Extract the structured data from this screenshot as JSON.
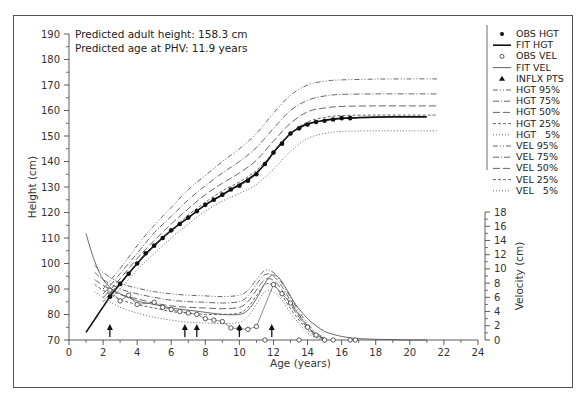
{
  "chart_data": {
    "type": "line",
    "title": "",
    "annotations": [
      "Predicted adult height: 158.3 cm",
      "Predicted age at PHV: 11.9 years"
    ],
    "xlabel": "Age (years)",
    "ylabel": "Height (cm)",
    "y2label": "Velocity (cm)",
    "xlim": [
      0,
      24
    ],
    "ylim": [
      70,
      190
    ],
    "y2lim": [
      0,
      18
    ],
    "x_ticks": [
      "0",
      "2",
      "4",
      "6",
      "8",
      "10",
      "12",
      "14",
      "16",
      "18",
      "20",
      "22",
      "24"
    ],
    "y_ticks": [
      "70",
      "80",
      "90",
      "100",
      "110",
      "120",
      "130",
      "140",
      "150",
      "160",
      "170",
      "180",
      "190"
    ],
    "y2_ticks": [
      "0",
      "2",
      "4",
      "6",
      "8",
      "10",
      "12",
      "14",
      "16",
      "18"
    ],
    "grid": false,
    "legend_position": "right",
    "legend": [
      {
        "label": "OBS HGT",
        "style": "filled-dot"
      },
      {
        "label": "FIT HGT",
        "style": "solid-thick"
      },
      {
        "label": "OBS VEL",
        "style": "open-circle"
      },
      {
        "label": "FIT VEL",
        "style": "solid-thin"
      },
      {
        "label": "INFLX PTS",
        "style": "triangle"
      },
      {
        "label": "HGT 95%",
        "style": "dash-dot-dot"
      },
      {
        "label": "HGT 75%",
        "style": "dash-dot"
      },
      {
        "label": "HGT 50%",
        "style": "long-dash"
      },
      {
        "label": "HGT 25%",
        "style": "short-dash"
      },
      {
        "label": "HGT   5%",
        "style": "dotted"
      },
      {
        "label": "VEL 95%",
        "style": "dash-dot-dot"
      },
      {
        "label": "VEL 75%",
        "style": "dash-dot"
      },
      {
        "label": "VEL 50%",
        "style": "long-dash"
      },
      {
        "label": "VEL 25%",
        "style": "short-dash"
      },
      {
        "label": "VEL   5%",
        "style": "dotted"
      }
    ],
    "inflection_arrows_age": [
      2.4,
      6.8,
      7.5,
      10.0,
      11.9
    ],
    "series": [
      {
        "name": "OBS HGT",
        "axis": "height",
        "x": [
          2.4,
          3.0,
          3.5,
          4.0,
          4.5,
          5.0,
          5.5,
          6.0,
          6.5,
          7.0,
          7.5,
          8.0,
          8.5,
          9.0,
          9.5,
          10.0,
          10.5,
          11.0,
          11.5,
          12.0,
          12.5,
          13.0,
          13.5,
          14.0,
          14.5,
          15.0,
          15.5,
          16.0,
          16.5
        ],
        "values": [
          87,
          92,
          96,
          100,
          104,
          107,
          110,
          113,
          115.5,
          118,
          120.5,
          123,
          125,
          127,
          129,
          130.5,
          132.5,
          135,
          139,
          143.5,
          147,
          151,
          153,
          154.5,
          155.5,
          156,
          156.5,
          157,
          157
        ]
      },
      {
        "name": "FIT HGT",
        "axis": "height",
        "x": [
          1.0,
          1.5,
          2.0,
          2.5,
          3.0,
          4.0,
          5.0,
          6.0,
          7.0,
          8.0,
          9.0,
          10.0,
          10.5,
          11.0,
          11.5,
          12.0,
          12.5,
          13.0,
          13.5,
          14.0,
          15.0,
          16.0,
          17.0,
          18.0,
          19.0,
          20.0,
          21.0
        ],
        "values": [
          73,
          78,
          83,
          88,
          92,
          100,
          107,
          113,
          118,
          123,
          127,
          131,
          133,
          135.5,
          139,
          143.5,
          147.5,
          151,
          153.2,
          154.8,
          156.2,
          156.9,
          157.2,
          157.4,
          157.5,
          157.5,
          157.5
        ]
      },
      {
        "name": "HGT 95%",
        "axis": "height",
        "x": [
          2.0,
          3.0,
          4.0,
          5.0,
          6.0,
          7.0,
          8.0,
          9.0,
          10.0,
          11.0,
          12.0,
          13.0,
          14.0,
          15.0,
          16.0,
          18.0,
          20.0,
          21.6
        ],
        "values": [
          90,
          98,
          107,
          115,
          122,
          129,
          134.5,
          140,
          145,
          151,
          159,
          166,
          170,
          171.5,
          172,
          172.3,
          172.4,
          172.4
        ]
      },
      {
        "name": "HGT 75%",
        "axis": "height",
        "x": [
          2.0,
          3.0,
          4.0,
          5.0,
          6.0,
          7.0,
          8.0,
          9.0,
          10.0,
          11.0,
          12.0,
          13.0,
          14.0,
          15.0,
          16.0,
          18.0,
          20.0,
          21.6
        ],
        "values": [
          88,
          96,
          104,
          112,
          118.5,
          125,
          130.5,
          135.5,
          140,
          145.5,
          153,
          160,
          164,
          165.7,
          166.3,
          166.5,
          166.5,
          166.5
        ]
      },
      {
        "name": "HGT 50%",
        "axis": "height",
        "x": [
          2.0,
          3.0,
          4.0,
          5.0,
          6.0,
          7.0,
          8.0,
          9.0,
          10.0,
          11.0,
          12.0,
          13.0,
          14.0,
          15.0,
          16.0,
          18.0,
          20.0,
          21.6
        ],
        "values": [
          86.5,
          94,
          102,
          109,
          115.5,
          121.5,
          127,
          131.5,
          135.5,
          140.5,
          148,
          155,
          159.5,
          161,
          161.6,
          161.8,
          161.8,
          161.8
        ]
      },
      {
        "name": "HGT 25%",
        "axis": "height",
        "x": [
          2.0,
          3.0,
          4.0,
          5.0,
          6.0,
          7.0,
          8.0,
          9.0,
          10.0,
          11.0,
          12.0,
          13.0,
          14.0,
          15.0,
          16.0,
          18.0,
          20.0,
          21.6
        ],
        "values": [
          85,
          92.5,
          100,
          107,
          113,
          119,
          124,
          128.5,
          132,
          136.5,
          143.5,
          151,
          155.5,
          157.3,
          158,
          158.2,
          158.2,
          158.2
        ]
      },
      {
        "name": "HGT 5%",
        "axis": "height",
        "x": [
          2.0,
          3.0,
          4.0,
          5.0,
          6.0,
          7.0,
          8.0,
          9.0,
          10.0,
          11.0,
          12.0,
          13.0,
          14.0,
          15.0,
          16.0,
          18.0,
          20.0,
          21.6
        ],
        "values": [
          83,
          90,
          97.5,
          104,
          110,
          115.5,
          120.5,
          124.5,
          127.5,
          131,
          137,
          144,
          149,
          151,
          151.8,
          152,
          152,
          152
        ]
      },
      {
        "name": "OBS VEL",
        "axis": "velocity",
        "x": [
          2.4,
          3.0,
          3.5,
          4.0,
          5.0,
          5.5,
          6.0,
          6.5,
          7.0,
          7.5,
          8.0,
          8.5,
          9.0,
          9.5,
          10.0,
          10.5,
          11.0,
          11.5,
          12.0,
          12.5,
          13.0,
          13.5,
          14.0,
          14.5,
          15.0,
          15.5,
          16.5,
          16.8
        ],
        "values": [
          7.0,
          5.5,
          6.3,
          5.0,
          5.3,
          4.6,
          4.3,
          4.0,
          3.8,
          3.6,
          3.0,
          2.8,
          2.6,
          1.7,
          1.6,
          1.5,
          1.9,
          0.0,
          7.8,
          6.5,
          5.2,
          0.0,
          1.8,
          0.7,
          0.0,
          0.0,
          0.0,
          0.0
        ]
      },
      {
        "name": "FIT VEL",
        "axis": "velocity",
        "x": [
          1.0,
          1.3,
          1.6,
          2.0,
          2.5,
          3.0,
          4.0,
          5.0,
          6.0,
          7.0,
          8.0,
          9.0,
          10.0,
          10.5,
          11.0,
          11.5,
          11.9,
          12.3,
          12.8,
          13.3,
          14.0,
          14.5,
          15.0,
          15.5,
          16.0,
          16.5,
          17.0,
          18.0,
          19.0,
          20.0,
          21.0
        ],
        "values": [
          15.0,
          12.5,
          10.5,
          8.5,
          7.2,
          6.5,
          5.5,
          5.0,
          4.5,
          4.2,
          3.9,
          3.6,
          3.6,
          4.2,
          5.8,
          8.0,
          9.1,
          8.8,
          7.0,
          5.0,
          3.0,
          2.0,
          1.2,
          0.8,
          0.5,
          0.3,
          0.2,
          0.1,
          0.05,
          0.0,
          0.0
        ]
      },
      {
        "name": "VEL 95%",
        "axis": "velocity",
        "x": [
          1.5,
          2.0,
          3.0,
          4.0,
          5.0,
          6.0,
          7.0,
          8.0,
          9.0,
          10.0,
          10.5,
          11.0,
          11.5,
          12.0,
          12.5,
          13.0,
          13.5,
          14.0,
          14.5,
          15.0
        ],
        "values": [
          10.5,
          9.5,
          8.0,
          7.3,
          6.8,
          6.5,
          6.3,
          6.2,
          6.1,
          6.3,
          7.0,
          8.5,
          9.8,
          9.5,
          8.0,
          6.0,
          4.0,
          2.3,
          1.0,
          0.3
        ]
      },
      {
        "name": "VEL 75%",
        "axis": "velocity",
        "x": [
          1.5,
          2.0,
          3.0,
          4.0,
          5.0,
          6.0,
          7.0,
          8.0,
          9.0,
          10.0,
          10.5,
          11.0,
          11.5,
          12.0,
          12.5,
          13.0,
          13.5,
          14.0,
          14.5,
          15.0
        ],
        "values": [
          9.5,
          8.5,
          7.2,
          6.5,
          6.0,
          5.6,
          5.4,
          5.3,
          5.2,
          5.4,
          6.2,
          7.8,
          9.2,
          9.0,
          7.5,
          5.5,
          3.6,
          2.0,
          0.8,
          0.2
        ]
      },
      {
        "name": "VEL 50%",
        "axis": "velocity",
        "x": [
          1.5,
          2.0,
          3.0,
          4.0,
          5.0,
          6.0,
          7.0,
          8.0,
          9.0,
          10.0,
          10.5,
          11.0,
          11.5,
          12.0,
          12.5,
          13.0,
          13.5,
          14.0,
          14.5,
          15.0
        ],
        "values": [
          8.5,
          7.7,
          6.4,
          5.8,
          5.2,
          4.8,
          4.6,
          4.5,
          4.4,
          4.6,
          5.4,
          7.0,
          8.5,
          8.4,
          7.0,
          5.0,
          3.2,
          1.7,
          0.7,
          0.2
        ]
      },
      {
        "name": "VEL 25%",
        "axis": "velocity",
        "x": [
          1.5,
          2.0,
          3.0,
          4.0,
          5.0,
          6.0,
          7.0,
          8.0,
          9.0,
          10.0,
          10.5,
          11.0,
          11.5,
          12.0,
          12.5,
          13.0,
          13.5,
          14.0,
          14.5,
          15.0
        ],
        "values": [
          7.8,
          7.0,
          5.7,
          5.0,
          4.5,
          4.0,
          3.8,
          3.6,
          3.6,
          3.8,
          4.6,
          6.2,
          7.8,
          7.7,
          6.3,
          4.4,
          2.8,
          1.4,
          0.5,
          0.1
        ]
      },
      {
        "name": "VEL 5%",
        "axis": "velocity",
        "x": [
          1.5,
          2.0,
          3.0,
          4.0,
          5.0,
          6.0,
          7.0,
          8.0,
          9.0,
          10.0,
          10.5,
          11.0,
          11.5,
          12.0,
          12.5,
          13.0,
          13.5,
          14.0,
          14.5,
          15.0
        ],
        "values": [
          6.8,
          6.0,
          4.6,
          3.8,
          3.2,
          2.8,
          2.5,
          2.4,
          2.3,
          2.5,
          3.3,
          5.0,
          6.8,
          6.8,
          5.6,
          3.8,
          2.3,
          1.0,
          0.3,
          0.0
        ]
      }
    ]
  }
}
